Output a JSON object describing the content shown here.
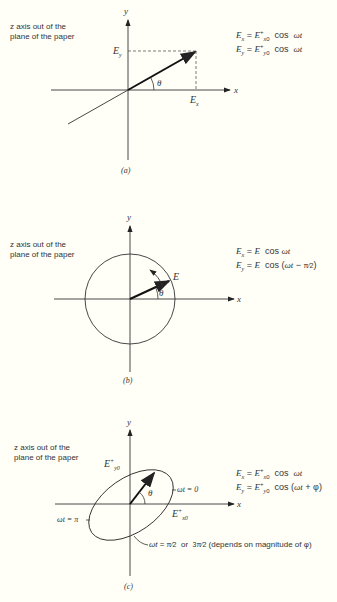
{
  "panels": [
    {
      "id": "a",
      "caption": "(a)",
      "note": [
        "z axis out of the",
        "plane of the paper"
      ],
      "axis_x": "x",
      "axis_y": "y",
      "labels": {
        "ey": "Ey",
        "ex": "Ex",
        "theta": "θ"
      },
      "equations": [
        "Ex = E+x0  cos ωt",
        "Ey = E+y0  cos ωt"
      ]
    },
    {
      "id": "b",
      "caption": "(b)",
      "note": [
        "z axis out of the",
        "plane of the paper"
      ],
      "axis_x": "x",
      "axis_y": "y",
      "labels": {
        "e": "E",
        "theta": "θ"
      },
      "equations": [
        "Ex = E  cos ωt",
        "Ey = E  cos (ωt − π/2)"
      ]
    },
    {
      "id": "c",
      "caption": "(c)",
      "note": [
        "z axis out of the",
        "plane of the paper"
      ],
      "axis_x": "x",
      "axis_y": "y",
      "labels": {
        "ey0": "E+y0",
        "ex0": "E+x0",
        "theta": "θ",
        "wt0": "ωt = 0",
        "wtpi": "ωt = π",
        "wthalf": "ωt = π/2  or  3π/2 (depends on magnitude of φ)"
      },
      "equations": [
        "Ex = E+x0  cos ωt",
        "Ey = E+y0  cos (ωt + φ)"
      ]
    }
  ]
}
